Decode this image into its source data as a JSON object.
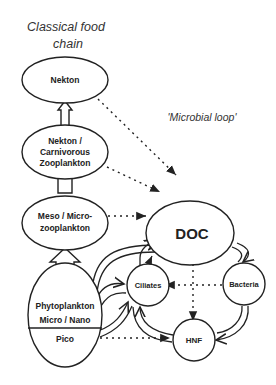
{
  "titles": {
    "classical": [
      "Classical  food",
      "chain"
    ],
    "microbial": "'Microbial loop'"
  },
  "nodes": {
    "nekton": [
      "Nekton"
    ],
    "carnivorous": [
      "Nekton /",
      "Carnivorous",
      "Zooplankton"
    ],
    "meso": [
      "Meso / Micro-",
      "zooplankton"
    ],
    "phyto": [
      "Phytoplankton",
      "Micro / Nano"
    ],
    "pico": [
      "Pico"
    ],
    "doc": [
      "DOC"
    ],
    "ciliates": [
      "Ciliates"
    ],
    "bacteria": [
      "Bacteria"
    ],
    "hnf": [
      "HNF"
    ]
  }
}
